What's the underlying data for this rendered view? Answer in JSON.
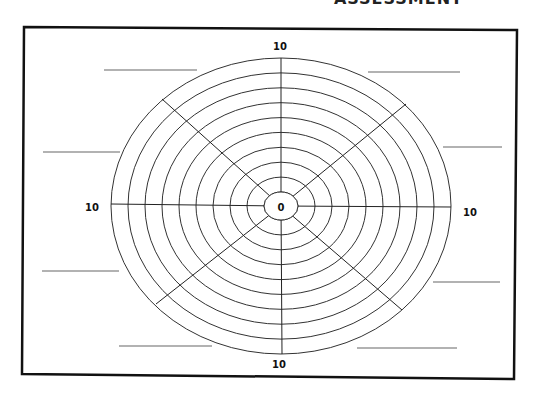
{
  "worksheet": {
    "clipped_title": "ASSESSMENT",
    "frame": {
      "points": [
        [
          24,
          27
        ],
        [
          517,
          30
        ],
        [
          514,
          379
        ],
        [
          22,
          374
        ]
      ],
      "stroke": "#111111",
      "stroke_width": 2.5
    },
    "wheel": {
      "center": [
        281,
        206
      ],
      "outer_radius_x": 170,
      "outer_radius_y": 148,
      "ring_count": 10,
      "inner_radius_x": 17,
      "inner_radius_y": 14,
      "ring_color": "#333333",
      "spoke_color": "#222222",
      "spokes": [
        {
          "name": "spoke-top",
          "to": [
            281,
            58
          ]
        },
        {
          "name": "spoke-top-right",
          "to": [
            406,
            104
          ]
        },
        {
          "name": "spoke-right",
          "to": [
            451,
            207
          ]
        },
        {
          "name": "spoke-bottom-right",
          "to": [
            402,
            310
          ]
        },
        {
          "name": "spoke-bottom",
          "to": [
            282,
            354
          ]
        },
        {
          "name": "spoke-bottom-left",
          "to": [
            156,
            304
          ]
        },
        {
          "name": "spoke-left",
          "to": [
            111,
            204
          ]
        },
        {
          "name": "spoke-top-left",
          "to": [
            162,
            99
          ]
        }
      ]
    },
    "scale_labels": {
      "center": "0",
      "top": "10",
      "bottom": "10",
      "left": "10",
      "right": "10"
    },
    "scale_label_positions": {
      "center": [
        281,
        211
      ],
      "top": [
        280,
        50
      ],
      "bottom": [
        279,
        368
      ],
      "left": [
        92,
        211
      ],
      "right": [
        470,
        216
      ]
    },
    "blank_lines": {
      "color": "#666666",
      "items": [
        {
          "name": "blank-line-top-left",
          "x1": 104,
          "y1": 70,
          "x2": 197,
          "y2": 70
        },
        {
          "name": "blank-line-upper-left",
          "x1": 43,
          "y1": 152,
          "x2": 120,
          "y2": 152
        },
        {
          "name": "blank-line-lower-left",
          "x1": 42,
          "y1": 271,
          "x2": 119,
          "y2": 271
        },
        {
          "name": "blank-line-bottom-left",
          "x1": 119,
          "y1": 346,
          "x2": 212,
          "y2": 346
        },
        {
          "name": "blank-line-top-right",
          "x1": 368,
          "y1": 72,
          "x2": 460,
          "y2": 72
        },
        {
          "name": "blank-line-upper-right",
          "x1": 443,
          "y1": 147,
          "x2": 502,
          "y2": 147
        },
        {
          "name": "blank-line-lower-right",
          "x1": 433,
          "y1": 282,
          "x2": 500,
          "y2": 282
        },
        {
          "name": "blank-line-bottom-right",
          "x1": 357,
          "y1": 348,
          "x2": 457,
          "y2": 348
        }
      ]
    },
    "colors": {
      "background": "#ffffff",
      "label_text": "#111111"
    }
  }
}
